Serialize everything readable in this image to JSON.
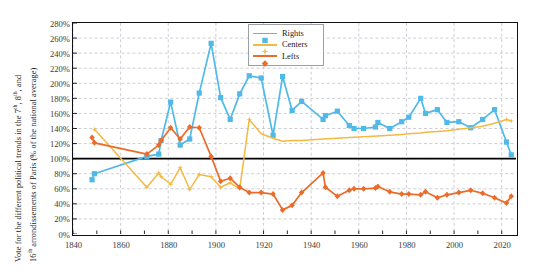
{
  "chart_data": {
    "type": "line",
    "title": "",
    "ylabel": "Vote for the different political trends in the 7th, 8th, and 16th arrondissements of Paris (% of the national average)",
    "ylabel_line1": "Vote for the different political trends in the 7 , 8 , and",
    "ylabel_line1_a": "Vote for the different political trends in the 7",
    "ylabel_line1_sup1": "th",
    "ylabel_line1_b": ", 8",
    "ylabel_line1_sup2": "th",
    "ylabel_line1_c": ", and",
    "ylabel_line2_a": "16",
    "ylabel_line2_sup": "th",
    "ylabel_line2_b": " arrondissements of Paris (% of the national average)",
    "xlabel": "",
    "xlim": [
      1840,
      2026
    ],
    "ylim": [
      0,
      280
    ],
    "xticks": [
      1840,
      1860,
      1880,
      1900,
      1920,
      1940,
      1960,
      1980,
      2000,
      2020
    ],
    "xtick_labels": [
      "1840",
      "1860",
      "1880",
      "1900",
      "1920",
      "1940",
      "1960",
      "1980",
      "2000",
      "2020"
    ],
    "yticks": [
      0,
      20,
      40,
      60,
      80,
      100,
      120,
      140,
      160,
      180,
      200,
      220,
      240,
      260,
      280
    ],
    "ytick_labels": [
      "0%",
      "20%",
      "40%",
      "60%",
      "80%",
      "100%",
      "120%",
      "140%",
      "160%",
      "180%",
      "200%",
      "220%",
      "240%",
      "260%",
      "280%"
    ],
    "grid": true,
    "grid_style": "dashed",
    "reference_line": 100,
    "legend_position": "top-center-right",
    "colors": {
      "rights": "#4FB9E8",
      "centers": "#F5B942",
      "lefts": "#ED6B28",
      "grid": "#b9b9c4",
      "axis": "#111111",
      "reference": "#000000"
    },
    "series": [
      {
        "name": "Rights",
        "color": "#4FB9E8",
        "marker": "square",
        "points": [
          [
            1848,
            72
          ],
          [
            1849,
            80
          ],
          [
            1871,
            103
          ],
          [
            1876,
            106
          ],
          [
            1877,
            124
          ],
          [
            1881,
            175
          ],
          [
            1885,
            118
          ],
          [
            1889,
            126
          ],
          [
            1893,
            187
          ],
          [
            1898,
            253
          ],
          [
            1902,
            181
          ],
          [
            1906,
            152
          ],
          [
            1910,
            186
          ],
          [
            1914,
            210
          ],
          [
            1919,
            207
          ],
          [
            1924,
            131
          ],
          [
            1928,
            209
          ],
          [
            1932,
            164
          ],
          [
            1936,
            176
          ],
          [
            1945,
            152
          ],
          [
            1946,
            157
          ],
          [
            1951,
            163
          ],
          [
            1956,
            144
          ],
          [
            1958,
            140
          ],
          [
            1962,
            140
          ],
          [
            1967,
            142
          ],
          [
            1968,
            148
          ],
          [
            1973,
            140
          ],
          [
            1978,
            149
          ],
          [
            1981,
            155
          ],
          [
            1986,
            180
          ],
          [
            1988,
            160
          ],
          [
            1993,
            165
          ],
          [
            1997,
            148
          ],
          [
            2002,
            149
          ],
          [
            2007,
            141
          ],
          [
            2012,
            152
          ],
          [
            2017,
            165
          ],
          [
            2022,
            122
          ],
          [
            2024,
            105
          ]
        ]
      },
      {
        "name": "Centers",
        "color": "#F5B942",
        "marker": "star",
        "points": [
          [
            1849,
            139
          ],
          [
            1871,
            62
          ],
          [
            1876,
            81
          ],
          [
            1877,
            76
          ],
          [
            1881,
            66
          ],
          [
            1885,
            88
          ],
          [
            1889,
            59
          ],
          [
            1893,
            79
          ],
          [
            1898,
            76
          ],
          [
            1902,
            62
          ],
          [
            1906,
            68
          ],
          [
            1910,
            60
          ],
          [
            1914,
            152
          ],
          [
            1919,
            133
          ],
          [
            1924,
            127
          ],
          [
            1928,
            123
          ],
          [
            1932,
            124
          ],
          [
            1936,
            124
          ],
          [
            1945,
            126
          ],
          [
            1951,
            127
          ],
          [
            1956,
            128
          ],
          [
            1962,
            129
          ],
          [
            1968,
            130
          ],
          [
            1973,
            131
          ],
          [
            1978,
            132
          ],
          [
            1981,
            133
          ],
          [
            1986,
            134
          ],
          [
            1988,
            135
          ],
          [
            1993,
            136
          ],
          [
            1997,
            137
          ],
          [
            2002,
            139
          ],
          [
            2007,
            141
          ],
          [
            2012,
            143
          ],
          [
            2017,
            147
          ],
          [
            2022,
            152
          ],
          [
            2024,
            150
          ]
        ]
      },
      {
        "name": "Lefts",
        "color": "#ED6B28",
        "marker": "diamond",
        "points": [
          [
            1848,
            128
          ],
          [
            1849,
            121
          ],
          [
            1871,
            106
          ],
          [
            1876,
            118
          ],
          [
            1877,
            124
          ],
          [
            1881,
            141
          ],
          [
            1885,
            126
          ],
          [
            1889,
            142
          ],
          [
            1893,
            141
          ],
          [
            1898,
            103
          ],
          [
            1902,
            70
          ],
          [
            1906,
            74
          ],
          [
            1910,
            62
          ],
          [
            1914,
            55
          ],
          [
            1919,
            55
          ],
          [
            1924,
            53
          ],
          [
            1928,
            32
          ],
          [
            1932,
            38
          ],
          [
            1936,
            55
          ],
          [
            1945,
            81
          ],
          [
            1946,
            62
          ],
          [
            1951,
            50
          ],
          [
            1956,
            58
          ],
          [
            1958,
            60
          ],
          [
            1962,
            60
          ],
          [
            1967,
            61
          ],
          [
            1968,
            63
          ],
          [
            1973,
            56
          ],
          [
            1978,
            53
          ],
          [
            1981,
            53
          ],
          [
            1986,
            52
          ],
          [
            1988,
            56
          ],
          [
            1993,
            48
          ],
          [
            1997,
            52
          ],
          [
            2002,
            55
          ],
          [
            2007,
            58
          ],
          [
            2012,
            54
          ],
          [
            2017,
            48
          ],
          [
            2022,
            41
          ],
          [
            2024,
            50
          ]
        ]
      }
    ]
  },
  "legend": {
    "items": [
      {
        "label": "Rights",
        "color": "#4FB9E8",
        "marker": "square"
      },
      {
        "label": "Centers",
        "color": "#F5B942",
        "marker": "star"
      },
      {
        "label": "Lefts",
        "color": "#ED6B28",
        "marker": "diamond"
      }
    ]
  }
}
